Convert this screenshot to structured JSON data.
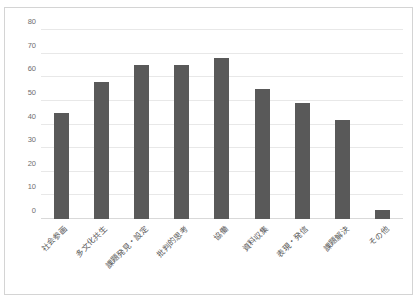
{
  "chart_data": {
    "type": "bar",
    "title": "",
    "xlabel": "",
    "ylabel": "",
    "ylim": [
      0,
      80
    ],
    "ytick_step": 10,
    "yticks": [
      0,
      10,
      20,
      30,
      40,
      50,
      60,
      70,
      80
    ],
    "grid": true,
    "legend": false,
    "bar_color": "#595959",
    "categories": [
      "社会参画",
      "多文化共生",
      "課題発見・設定",
      "批判的思考",
      "協働",
      "資料収集",
      "表現・発信",
      "課題解決",
      "その他"
    ],
    "values": [
      45,
      58,
      65,
      65,
      68,
      55,
      49,
      42,
      4
    ]
  },
  "frame": {
    "border_color": "#d4d4d4",
    "background": "#ffffff"
  }
}
